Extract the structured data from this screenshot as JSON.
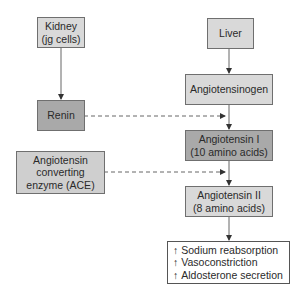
{
  "diagram": {
    "nodes": {
      "kidney": {
        "line1": "Kidney",
        "line2": "(jg cells)"
      },
      "renin": {
        "label": "Renin"
      },
      "ace": {
        "line1": "Angiotensin",
        "line2": "converting",
        "line3": "enzyme (ACE)"
      },
      "liver": {
        "label": "Liver"
      },
      "angiotensinogen": {
        "label": "Angiotensinogen"
      },
      "angiotensin1": {
        "line1": "Angiotensin I",
        "line2": "(10 amino acids)"
      },
      "angiotensin2": {
        "line1": "Angiotensin II",
        "line2": "(8 amino acids)"
      },
      "effects": {
        "arrow": "↑",
        "items": [
          "Sodium reabsorption",
          "Vasoconstriction",
          "Aldosterone secretion"
        ]
      }
    },
    "edges": [
      {
        "from": "kidney",
        "to": "renin",
        "style": "solid"
      },
      {
        "from": "liver",
        "to": "angiotensinogen",
        "style": "solid"
      },
      {
        "from": "angiotensinogen",
        "to": "angiotensin1",
        "style": "solid"
      },
      {
        "from": "renin",
        "to": "angiotensinogen-angiotensin1",
        "style": "dashed"
      },
      {
        "from": "angiotensin1",
        "to": "angiotensin2",
        "style": "solid"
      },
      {
        "from": "ace",
        "to": "angiotensin1-angiotensin2",
        "style": "dashed"
      },
      {
        "from": "angiotensin2",
        "to": "effects",
        "style": "solid"
      }
    ],
    "colors": {
      "light": "#d9d9d9",
      "dark": "#a9a9a9",
      "mid": "#cfcfcf",
      "line": "#555555"
    }
  }
}
